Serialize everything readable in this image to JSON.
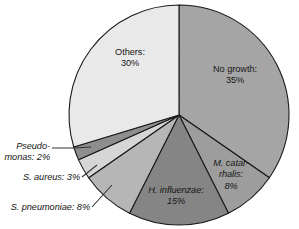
{
  "chart_data": {
    "type": "pie",
    "title": "",
    "subtitle": "",
    "xlabel": "",
    "ylabel": "",
    "legend_position": "none",
    "grid": false,
    "units": "percent",
    "total": 101,
    "start_angle_deg": 0,
    "direction": "clockwise",
    "categories": [
      "No growth",
      "M. catarrhalis",
      "H. influenzae",
      "S. pneumoniae",
      "S. aureus",
      "Pseudomonas",
      "Others"
    ],
    "values": [
      35,
      8,
      15,
      8,
      3,
      2,
      30
    ],
    "slices": [
      {
        "key": "no-growth",
        "name": "No growth",
        "value": 35,
        "value_text": "35%",
        "label_line_1": "No growth:",
        "label_line_2": "35%",
        "italic": false,
        "color": "#a5a5a5",
        "label_placement": "inside"
      },
      {
        "key": "m-catarrhalis",
        "name": "M. catarrhalis",
        "value": 8,
        "value_text": "8%",
        "label_line_1": "M. catar-",
        "label_line_2": "rhalis:",
        "label_line_3": "8%",
        "italic": true,
        "color": "#9d9d9d",
        "label_placement": "inside"
      },
      {
        "key": "h-influenzae",
        "name": "H. influenzae",
        "value": 15,
        "value_text": "15%",
        "label_line_1": "H. influenzae:",
        "label_line_2": "15%",
        "italic": true,
        "color": "#858585",
        "label_placement": "inside"
      },
      {
        "key": "s-pneumoniae",
        "name": "S. pneumoniae",
        "value": 8,
        "value_text": "8%",
        "label_line_1": "S. pneumoniae: 8%",
        "italic": true,
        "color": "#b6b6b6",
        "label_placement": "outside-left"
      },
      {
        "key": "s-aureus",
        "name": "S. aureus",
        "value": 3,
        "value_text": "3%",
        "label_line_1": "S. aureus: 3%",
        "italic": true,
        "color": "#d6d6d6",
        "label_placement": "outside-left"
      },
      {
        "key": "pseudomonas",
        "name": "Pseudomonas",
        "value": 2,
        "value_text": "2%",
        "label_line_1": "Pseudo-",
        "label_line_2": "monas: 2%",
        "italic": true,
        "color": "#8e8e8e",
        "label_placement": "outside-left"
      },
      {
        "key": "others",
        "name": "Others",
        "value": 30,
        "value_text": "30%",
        "label_line_1": "Others:",
        "label_line_2": "30%",
        "italic": false,
        "color": "#e9e9e9",
        "label_placement": "inside"
      }
    ],
    "colors": {
      "outline": "#1a1a1a",
      "background": "#ffffff",
      "text": "#161616",
      "leader": "#333333"
    },
    "geometry": {
      "center_x": 179,
      "center_y": 115,
      "radius": 110
    }
  }
}
